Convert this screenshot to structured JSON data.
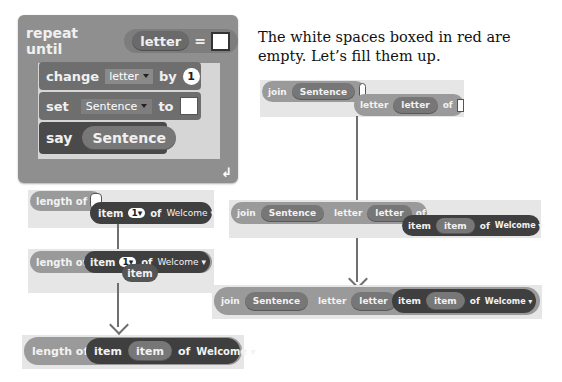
{
  "caption": {
    "line1": "The white spaces boxed in red are",
    "line2": "empty. Let’s fill them up."
  },
  "repeat_block": {
    "keyword": "repeat until",
    "condition_var": "letter",
    "operator": "=",
    "change_label": "change",
    "change_var": "letter",
    "by_label": "by",
    "by_value": "1",
    "set_label": "set",
    "set_var": "Sentence",
    "to_label": "to",
    "say_label": "say",
    "say_var": "Sentence"
  },
  "left_steps": {
    "step1": {
      "length_of": "length of",
      "item": "item",
      "index": "1",
      "of": "of",
      "list": "Welcome"
    },
    "step2": {
      "length_of": "length of",
      "item": "item",
      "index": "1",
      "of": "of",
      "list": "Welcome",
      "dragged": "item"
    },
    "step3": {
      "length_of": "length of",
      "item": "item",
      "var": "item",
      "of": "of",
      "list": "Welcome"
    }
  },
  "right_steps": {
    "step1": {
      "join": "join",
      "var": "Sentence",
      "letter": "letter",
      "letter_var": "letter",
      "of": "of"
    },
    "step2": {
      "join": "join",
      "var": "Sentence",
      "letter": "letter",
      "letter_var": "letter",
      "of": "of",
      "item": "item",
      "item_var": "item",
      "of2": "of",
      "list": "Welcome"
    },
    "step3": {
      "join": "join",
      "var": "Sentence",
      "letter": "letter",
      "letter_var": "letter",
      "of": "of",
      "item": "item",
      "item_var": "item",
      "of2": "of",
      "list": "Welcome"
    }
  },
  "colors": {
    "control": "#8e8e8e",
    "variables": "#6e6e6e",
    "operators": "#9a9a9a",
    "lists": "#3f3f3f",
    "looks": "#4a4a4a"
  }
}
